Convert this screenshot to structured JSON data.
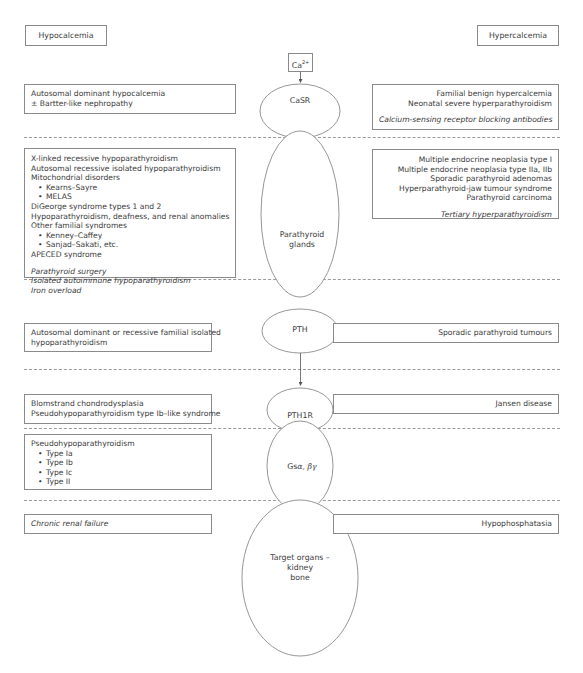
{
  "headers": {
    "left": "Hypocalcemia",
    "right": "Hypercalcemia"
  },
  "nodes": {
    "ca": "Ca2+",
    "ca_base": "Ca",
    "ca_sup": "2+",
    "casr": "CaSR",
    "parathyroid_line1": "Parathyroid",
    "parathyroid_line2": "glands",
    "pth": "PTH",
    "pth1r": "PTH1R",
    "gs_base": "Gs",
    "gs_greek": "α, βγ",
    "target_line1": "Target organs –",
    "target_line2": "kidney",
    "target_line3": "bone"
  },
  "rows": [
    {
      "level": "CaSR",
      "left": [
        "Autosomal dominant hypocalcemia",
        "± Bartter-like nephropathy"
      ],
      "right": [
        "Familial benign hypercalcemia",
        "Neonatal severe hyperparathyroidism"
      ],
      "right_italic": [
        "Calcium-sensing receptor blocking antibodies"
      ]
    },
    {
      "level": "Parathyroid glands",
      "left": [
        "X-linked recessive hypoparathyroidism",
        "Autosomal recessive isolated hypoparathyroidism",
        "Mitochondrial disorders",
        "Kearns–Sayre",
        "MELAS",
        "DiGeorge syndrome types 1 and 2",
        "Hypoparathyroidism, deafness, and renal anomalies",
        "Other familial syndromes",
        "Kenney–Caffey",
        "Sanjad–Sakati, etc.",
        "APECED syndrome"
      ],
      "left_italic": [
        "Parathyroid surgery",
        "Isolated autoimmune hypoparathyroidism",
        "Iron overload"
      ],
      "right": [
        "Multiple endocrine neoplasia type I",
        "Multiple endocrine neoplasia type IIa, IIb",
        "Sporadic parathyroid adenomas",
        "Hyperparathyroid-jaw tumour syndrome",
        "Parathyroid carcinoma"
      ],
      "right_italic": [
        "Tertiary hyperparathyroidism"
      ]
    },
    {
      "level": "PTH",
      "left": [
        "Autosomal dominant or recessive familial isolated",
        "hypoparathyroidism"
      ],
      "right": [
        "Sporadic parathyroid tumours"
      ]
    },
    {
      "level": "PTH1R",
      "left": [
        "Blomstrand chondrodysplasia",
        "Pseudohypoparathyroidism type Ib–like syndrome"
      ],
      "right": [
        "Jansen disease"
      ]
    },
    {
      "level": "Gs",
      "left": [
        "Pseudohypoparathyroidism",
        "Type Ia",
        "Type Ib",
        "Type Ic",
        "Type II"
      ]
    },
    {
      "level": "Target organs",
      "left_italic": [
        "Chronic renal failure"
      ],
      "right": [
        "Hypophosphatasia"
      ]
    }
  ]
}
